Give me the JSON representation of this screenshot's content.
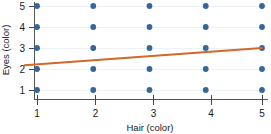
{
  "chart_data": {
    "type": "scatter",
    "title": "",
    "subtitle": "",
    "xlabel": "Hair (color)",
    "ylabel": "Eyes (color)",
    "xticks": [
      "1",
      "2",
      "3",
      "4",
      "5"
    ],
    "yticks": [
      "1",
      "2",
      "3",
      "4",
      "5"
    ],
    "xlim": [
      0.75,
      5.25
    ],
    "ylim": [
      0.6,
      5.4
    ],
    "grid": true,
    "legend": null,
    "series": [
      {
        "name": "observations",
        "type": "scatter",
        "color": "#35679c",
        "marker": "circle",
        "points": [
          {
            "x": 1,
            "y": 1
          },
          {
            "x": 1,
            "y": 2
          },
          {
            "x": 1,
            "y": 3
          },
          {
            "x": 1,
            "y": 4
          },
          {
            "x": 1,
            "y": 5
          },
          {
            "x": 2,
            "y": 1
          },
          {
            "x": 2,
            "y": 2
          },
          {
            "x": 2,
            "y": 3
          },
          {
            "x": 2,
            "y": 4
          },
          {
            "x": 2,
            "y": 5
          },
          {
            "x": 3,
            "y": 1
          },
          {
            "x": 3,
            "y": 2
          },
          {
            "x": 3,
            "y": 3
          },
          {
            "x": 3,
            "y": 4
          },
          {
            "x": 3,
            "y": 5
          },
          {
            "x": 4,
            "y": 1
          },
          {
            "x": 4,
            "y": 2
          },
          {
            "x": 4,
            "y": 3
          },
          {
            "x": 4,
            "y": 4
          },
          {
            "x": 4,
            "y": 5
          },
          {
            "x": 5,
            "y": 1
          },
          {
            "x": 5,
            "y": 2
          },
          {
            "x": 5,
            "y": 3
          },
          {
            "x": 5,
            "y": 4
          },
          {
            "x": 5,
            "y": 5
          }
        ]
      },
      {
        "name": "trend-line",
        "type": "line",
        "color": "#d2682a",
        "points": [
          {
            "x": 0.78,
            "y": 2.18
          },
          {
            "x": 5.0,
            "y": 3.0
          }
        ]
      }
    ],
    "colors": {
      "dot": "#35679c",
      "trend": "#d2682a",
      "axis": "#555555",
      "grid": "#eef2f7",
      "text": "#1a1a1a",
      "background": "#ffffff"
    }
  }
}
